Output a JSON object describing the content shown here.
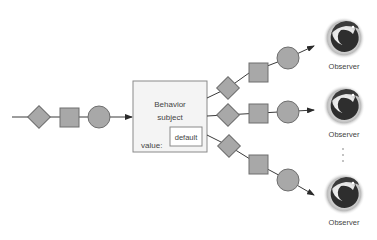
{
  "diagram": {
    "subject": {
      "title_line1": "Behavior",
      "title_line2": "subject",
      "value_label": "value:",
      "value": "default"
    },
    "observers": [
      {
        "label": "Observer"
      },
      {
        "label": "Observer"
      },
      {
        "label": "Observer"
      }
    ],
    "ellipsis": "⋮",
    "colors": {
      "shape_fill": "#a8a8a8",
      "shape_stroke": "#6e6e6e",
      "line": "#3a3a3a",
      "box_fill": "#f4f4f4",
      "box_stroke": "#8a8a8a",
      "observer_dark": "#2e2e2e",
      "observer_glow": "#bdbdbd"
    }
  }
}
